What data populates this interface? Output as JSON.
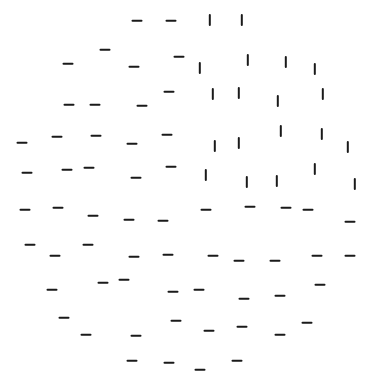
{
  "stimulus": {
    "type": "texture-segregation-display",
    "background_color": "#ffffff",
    "element_color": "#1a1a1a",
    "element_length_px": 11,
    "elements": [
      {
        "o": "h",
        "x": 137,
        "y": 21
      },
      {
        "o": "h",
        "x": 171,
        "y": 21
      },
      {
        "o": "v",
        "x": 210,
        "y": 20
      },
      {
        "o": "v",
        "x": 242,
        "y": 20
      },
      {
        "o": "h",
        "x": 105,
        "y": 50
      },
      {
        "o": "h",
        "x": 179,
        "y": 57
      },
      {
        "o": "h",
        "x": 68,
        "y": 64
      },
      {
        "o": "h",
        "x": 134,
        "y": 67
      },
      {
        "o": "v",
        "x": 200,
        "y": 68
      },
      {
        "o": "v",
        "x": 248,
        "y": 60
      },
      {
        "o": "v",
        "x": 286,
        "y": 62
      },
      {
        "o": "v",
        "x": 315,
        "y": 69
      },
      {
        "o": "h",
        "x": 69,
        "y": 105
      },
      {
        "o": "h",
        "x": 95,
        "y": 105
      },
      {
        "o": "h",
        "x": 142,
        "y": 106
      },
      {
        "o": "h",
        "x": 169,
        "y": 92
      },
      {
        "o": "v",
        "x": 213,
        "y": 94
      },
      {
        "o": "v",
        "x": 239,
        "y": 93
      },
      {
        "o": "v",
        "x": 278,
        "y": 101
      },
      {
        "o": "v",
        "x": 323,
        "y": 94
      },
      {
        "o": "h",
        "x": 22,
        "y": 143
      },
      {
        "o": "h",
        "x": 57,
        "y": 137
      },
      {
        "o": "h",
        "x": 96,
        "y": 136
      },
      {
        "o": "h",
        "x": 132,
        "y": 144
      },
      {
        "o": "h",
        "x": 167,
        "y": 135
      },
      {
        "o": "v",
        "x": 215,
        "y": 146
      },
      {
        "o": "v",
        "x": 239,
        "y": 143
      },
      {
        "o": "v",
        "x": 281,
        "y": 131
      },
      {
        "o": "v",
        "x": 322,
        "y": 134
      },
      {
        "o": "v",
        "x": 348,
        "y": 147
      },
      {
        "o": "h",
        "x": 27,
        "y": 173
      },
      {
        "o": "h",
        "x": 67,
        "y": 170
      },
      {
        "o": "h",
        "x": 89,
        "y": 168
      },
      {
        "o": "h",
        "x": 136,
        "y": 178
      },
      {
        "o": "h",
        "x": 171,
        "y": 167
      },
      {
        "o": "v",
        "x": 206,
        "y": 175
      },
      {
        "o": "v",
        "x": 247,
        "y": 182
      },
      {
        "o": "v",
        "x": 277,
        "y": 181
      },
      {
        "o": "v",
        "x": 315,
        "y": 169
      },
      {
        "o": "v",
        "x": 355,
        "y": 184
      },
      {
        "o": "h",
        "x": 25,
        "y": 210
      },
      {
        "o": "h",
        "x": 58,
        "y": 208
      },
      {
        "o": "h",
        "x": 93,
        "y": 216
      },
      {
        "o": "h",
        "x": 129,
        "y": 220
      },
      {
        "o": "h",
        "x": 163,
        "y": 221
      },
      {
        "o": "h",
        "x": 206,
        "y": 210
      },
      {
        "o": "h",
        "x": 250,
        "y": 207
      },
      {
        "o": "h",
        "x": 286,
        "y": 208
      },
      {
        "o": "h",
        "x": 308,
        "y": 210
      },
      {
        "o": "h",
        "x": 350,
        "y": 222
      },
      {
        "o": "h",
        "x": 30,
        "y": 245
      },
      {
        "o": "h",
        "x": 88,
        "y": 245
      },
      {
        "o": "h",
        "x": 55,
        "y": 256
      },
      {
        "o": "h",
        "x": 134,
        "y": 257
      },
      {
        "o": "h",
        "x": 168,
        "y": 255
      },
      {
        "o": "h",
        "x": 213,
        "y": 256
      },
      {
        "o": "h",
        "x": 239,
        "y": 261
      },
      {
        "o": "h",
        "x": 275,
        "y": 261
      },
      {
        "o": "h",
        "x": 317,
        "y": 256
      },
      {
        "o": "h",
        "x": 350,
        "y": 256
      },
      {
        "o": "h",
        "x": 52,
        "y": 290
      },
      {
        "o": "h",
        "x": 103,
        "y": 283
      },
      {
        "o": "h",
        "x": 124,
        "y": 280
      },
      {
        "o": "h",
        "x": 173,
        "y": 292
      },
      {
        "o": "h",
        "x": 199,
        "y": 290
      },
      {
        "o": "h",
        "x": 244,
        "y": 299
      },
      {
        "o": "h",
        "x": 280,
        "y": 296
      },
      {
        "o": "h",
        "x": 320,
        "y": 285
      },
      {
        "o": "h",
        "x": 64,
        "y": 318
      },
      {
        "o": "h",
        "x": 176,
        "y": 321
      },
      {
        "o": "h",
        "x": 86,
        "y": 335
      },
      {
        "o": "h",
        "x": 136,
        "y": 336
      },
      {
        "o": "h",
        "x": 209,
        "y": 331
      },
      {
        "o": "h",
        "x": 242,
        "y": 327
      },
      {
        "o": "h",
        "x": 280,
        "y": 335
      },
      {
        "o": "h",
        "x": 307,
        "y": 323
      },
      {
        "o": "h",
        "x": 132,
        "y": 361
      },
      {
        "o": "h",
        "x": 169,
        "y": 363
      },
      {
        "o": "h",
        "x": 200,
        "y": 370
      },
      {
        "o": "h",
        "x": 237,
        "y": 361
      }
    ]
  }
}
